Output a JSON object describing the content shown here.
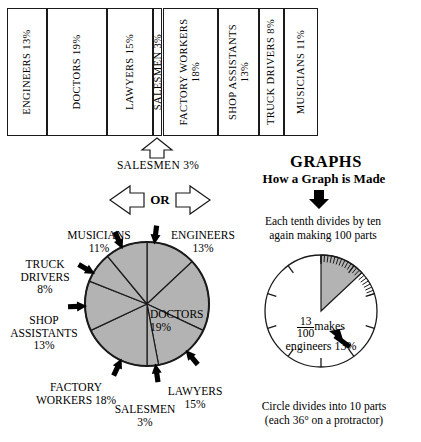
{
  "chart_data": {
    "type": "pie",
    "title": "GRAPHS",
    "subtitle": "How a Graph is Made",
    "categories": [
      "ENGINEERS",
      "DOCTORS",
      "LAWYERS",
      "SALESMEN",
      "FACTORY WORKERS",
      "SHOP ASSISTANTS",
      "TRUCK DRIVERS",
      "MUSICIANS"
    ],
    "values": [
      13,
      19,
      15,
      3,
      18,
      13,
      8,
      11
    ],
    "unit": "%",
    "legend": "none",
    "grid": false
  },
  "bar_chart": {
    "name": "stacked-percentage-bar",
    "segments": [
      {
        "label": "ENGINEERS 13%",
        "name": "engineers",
        "value": 13,
        "wrap": false
      },
      {
        "label": "DOCTORS 19%",
        "name": "doctors",
        "value": 19,
        "wrap": false
      },
      {
        "label": "LAWYERS 15%",
        "name": "lawyers",
        "value": 15,
        "wrap": false
      },
      {
        "label": "SALESMEN 3%",
        "name": "salesmen",
        "value": 3,
        "wrap": false
      },
      {
        "label": "FACTORY WORKERS 18%",
        "name": "factory-workers",
        "value": 18,
        "wrap": true
      },
      {
        "label": "SHOP ASSISTANTS 13%",
        "name": "shop-assistants",
        "value": 13,
        "wrap": true
      },
      {
        "label": "TRUCK DRIVERS 8%",
        "name": "truck-drivers",
        "value": 8,
        "wrap": false
      },
      {
        "label": "MUSICIANS 11%",
        "name": "musicians",
        "value": 11,
        "wrap": false
      }
    ]
  },
  "callout": {
    "salesmen_label": "SALESMEN 3%",
    "or_label": "OR"
  },
  "right_panel": {
    "title": "GRAPHS",
    "subtitle": "How a Graph is Made",
    "tenth_note_line1": "Each tenth divides by ten",
    "tenth_note_line2": "again making 100 parts",
    "fraction_numerator": "13",
    "fraction_denominator": "100",
    "fraction_suffix": "makes",
    "fraction_result": "engineers 13%",
    "caption_line1": "Circle divides into 10 parts",
    "caption_line2": "(each 36° on a protractor)",
    "major_divisions": 10,
    "highlight_percent": 13
  },
  "pie": {
    "fill_color": "#b3b3b3",
    "stroke_color": "#1a1a1a",
    "labels": [
      {
        "name": "musicians",
        "lines": [
          "MUSICIANS",
          "11%"
        ]
      },
      {
        "name": "engineers",
        "lines": [
          "ENGINEERS",
          "13%"
        ]
      },
      {
        "name": "truck-drivers",
        "lines": [
          "TRUCK",
          "DRIVERS",
          "8%"
        ]
      },
      {
        "name": "shop-assistants",
        "lines": [
          "SHOP",
          "ASSISTANTS",
          "13%"
        ]
      },
      {
        "name": "doctors",
        "lines": [
          "DOCTORS",
          "19%"
        ]
      },
      {
        "name": "factory-workers",
        "lines": [
          "FACTORY",
          "WORKERS 18%"
        ]
      },
      {
        "name": "salesmen",
        "lines": [
          "SALESMEN",
          "3%"
        ]
      },
      {
        "name": "lawyers",
        "lines": [
          "LAWYERS",
          "15%"
        ]
      }
    ]
  }
}
